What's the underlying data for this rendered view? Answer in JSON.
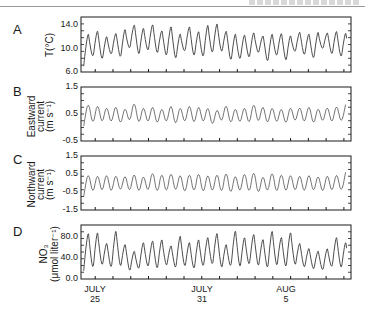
{
  "chart_data": [
    {
      "type": "line",
      "panel": "A",
      "ylabel": "T(°C)",
      "yticks": [
        "6.0",
        "10.0",
        "14.0"
      ],
      "ylim": [
        6.0,
        15.5
      ],
      "x_start_day": 24.2,
      "x_end_day": 39.4,
      "note": "semidiurnal oscillation; peaks/troughs per half-day cycle",
      "peaks": [
        13.0,
        13.5,
        12.5,
        13.0,
        13.8,
        14.5,
        14.0,
        14.6,
        13.5,
        14.3,
        13.0,
        14.2,
        13.4,
        14.6,
        14.8,
        13.4,
        13.0,
        12.8,
        13.2,
        12.5,
        13.0,
        13.0,
        12.7,
        13.2,
        12.9,
        13.3,
        13.0,
        13.4,
        13.1,
        13.6,
        13.2,
        13.0
      ],
      "troughs": [
        7.0,
        8.0,
        7.5,
        8.5,
        7.8,
        9.5,
        8.2,
        9.0,
        8.5,
        8.0,
        7.5,
        9.0,
        8.0,
        7.8,
        8.5,
        8.8,
        7.2,
        7.5,
        7.8,
        8.8,
        7.0,
        8.2,
        7.2,
        9.0,
        8.3,
        7.6,
        9.6,
        8.4,
        7.9,
        9.3,
        10.0,
        10.5
      ]
    },
    {
      "type": "line",
      "panel": "B",
      "ylabel": [
        "Eastward",
        "current",
        "(m s⁻¹)"
      ],
      "yticks": [
        "-0.5",
        "0.5",
        "1.5"
      ],
      "ylim": [
        -0.5,
        1.5
      ],
      "x_start_day": 24.2,
      "x_end_day": 39.4,
      "peaks": [
        1.1,
        1.05,
        0.95,
        1.0,
        0.9,
        1.15,
        0.95,
        1.0,
        0.9,
        1.05,
        0.95,
        1.05,
        1.0,
        0.95,
        0.85,
        1.05,
        0.9,
        0.95,
        1.1,
        1.0,
        0.95,
        0.9,
        0.95,
        0.95,
        1.0,
        0.9,
        0.95,
        1.0,
        0.85,
        0.95,
        0.8,
        0.8
      ],
      "troughs": [
        0.05,
        -0.05,
        0.0,
        0.0,
        -0.05,
        0.05,
        -0.05,
        0.0,
        -0.05,
        0.0,
        -0.1,
        0.0,
        -0.05,
        0.0,
        -0.1,
        0.05,
        -0.05,
        0.0,
        -0.05,
        0.0,
        -0.05,
        0.0,
        -0.05,
        0.05,
        0.0,
        -0.05,
        0.05,
        0.0,
        0.05,
        0.1,
        0.1,
        0.2
      ]
    },
    {
      "type": "line",
      "panel": "C",
      "ylabel": [
        "Northward",
        "current",
        "(m s⁻¹)"
      ],
      "yticks": [
        "-1.5",
        "-0.5",
        "0.5",
        "1.5"
      ],
      "ylim": [
        -1.5,
        1.5
      ],
      "x_start_day": 24.2,
      "x_end_day": 39.4,
      "peaks": [
        0.8,
        0.75,
        0.8,
        0.75,
        0.7,
        0.85,
        0.7,
        0.95,
        0.85,
        0.9,
        0.8,
        0.85,
        0.9,
        0.8,
        0.85,
        0.95,
        0.75,
        0.9,
        1.0,
        0.7,
        0.95,
        0.85,
        0.8,
        0.75,
        0.8,
        0.7,
        0.75,
        0.8,
        0.6,
        0.55,
        0.5,
        0.5
      ],
      "troughs": [
        -0.75,
        -0.8,
        -0.75,
        -0.8,
        -0.7,
        -0.75,
        -0.8,
        -0.75,
        -0.85,
        -0.8,
        -0.75,
        -0.85,
        -0.8,
        -0.85,
        -0.8,
        -0.85,
        -0.9,
        -0.8,
        -0.85,
        -0.9,
        -0.8,
        -0.85,
        -0.8,
        -0.75,
        -0.8,
        -0.75,
        -0.8,
        -0.75,
        -0.7,
        -0.65,
        -0.6,
        -0.55
      ]
    },
    {
      "type": "line",
      "panel": "D",
      "ylabel": [
        "NO₃",
        "(μmol liter⁻¹)"
      ],
      "yticks": [
        "0.0",
        "40.0",
        "80.0"
      ],
      "ylim": [
        0.0,
        100.0
      ],
      "x_start_day": 24.2,
      "x_end_day": 39.4,
      "xticks": [
        {
          "day": 25,
          "label": [
            "JULY",
            "25"
          ]
        },
        {
          "day": 31,
          "label": [
            "JULY",
            "31"
          ]
        },
        {
          "day": 36,
          "label": [
            "AUG",
            "5"
          ]
        }
      ],
      "peaks": [
        90,
        92,
        70,
        95,
        68,
        55,
        72,
        75,
        78,
        65,
        85,
        72,
        78,
        82,
        90,
        68,
        95,
        82,
        88,
        78,
        95,
        82,
        92,
        70,
        60,
        55,
        60,
        82,
        72,
        68,
        40,
        35
      ],
      "troughs": [
        15,
        10,
        18,
        12,
        15,
        8,
        12,
        15,
        10,
        18,
        12,
        15,
        10,
        15,
        18,
        12,
        15,
        12,
        18,
        15,
        10,
        15,
        12,
        18,
        15,
        12,
        10,
        15,
        12,
        18,
        22,
        25
      ]
    }
  ],
  "panels": {
    "A": {
      "letter": "A",
      "ylabel": "T(°C)",
      "ticks": [
        "14.0",
        "10.0",
        "6.0"
      ]
    },
    "B": {
      "letter": "B",
      "ylabel1": "Eastward",
      "ylabel2": "current",
      "ylabel3": "(m s⁻¹)",
      "ticks": [
        "1.5",
        "0.5",
        "-0.5"
      ]
    },
    "C": {
      "letter": "C",
      "ylabel1": "Northward",
      "ylabel2": "current",
      "ylabel3": "(m s⁻¹)",
      "ticks": [
        "1.5",
        "0.5",
        "-0.5",
        "-1.5"
      ]
    },
    "D": {
      "letter": "D",
      "ylabel1": "NO₃",
      "ylabel2": "(μmol liter⁻¹)",
      "ticks": [
        "80.0",
        "40.0",
        "0.0"
      ]
    }
  },
  "xaxis": {
    "labels": [
      {
        "month": "JULY",
        "day": "25"
      },
      {
        "month": "JULY",
        "day": "31"
      },
      {
        "month": "AUG",
        "day": "5"
      }
    ]
  },
  "colors": {
    "line": "#3a3a3a",
    "axis": "#1a1a1a"
  }
}
